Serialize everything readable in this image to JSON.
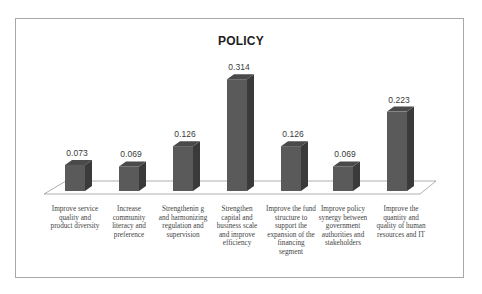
{
  "chart_data": {
    "type": "bar",
    "title": "POLICY",
    "categories": [
      "Improve service quality and product diversity",
      "Increase community literacy and preference",
      "Strengthening and harmonizing regulation and supervision",
      "Strengthen capital and business scale and improve efficiency",
      "Improve the fund structure to support the expansion of the financing segment",
      "Improve policy synergy between government authorities and stakeholders",
      "Improve the quantity and quality of human resources and IT"
    ],
    "category_labels_display": [
      "Improve service quality and product diversity",
      "Increase community literacy and preference",
      "Strengthenin g and harmonizing regulation and supervision",
      "Strengthen capital and business scale and improve efficiency",
      "Improve the fund structure to support the expansion of the financing segment",
      "Improve policy synergy between government authorities and stakeholders",
      "Improve the quantity and quality of human resources and IT"
    ],
    "values": [
      0.073,
      0.069,
      0.126,
      0.314,
      0.126,
      0.069,
      0.223
    ],
    "value_labels": [
      "0.073",
      "0.069",
      "0.126",
      "0.314",
      "0.126",
      "0.069",
      "0.223"
    ],
    "xlabel": "",
    "ylabel": "",
    "ylim": [
      0,
      0.35
    ],
    "grid": false,
    "legend": "none",
    "style": "3d-column",
    "colors": {
      "bar_front": "#5a5a5a",
      "bar_side": "#3a3a3a",
      "bar_top": "#4a4a4a"
    }
  },
  "labels": {
    "title": "POLICY",
    "values": [
      "0.073",
      "0.069",
      "0.126",
      "0.314",
      "0.126",
      "0.069",
      "0.223"
    ],
    "categories": [
      "Improve service quality and product diversity",
      "Increase community literacy and preference",
      "Strengthenin g and harmonizing regulation and supervision",
      "Strengthen capital and business scale and improve efficiency",
      "Improve the fund structure to support the expansion of the financing segment",
      "Improve policy synergy between government authorities and stakeholders",
      "Improve the quantity and quality of human resources and IT"
    ]
  }
}
